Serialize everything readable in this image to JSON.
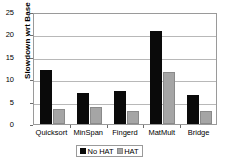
{
  "chart_data": {
    "type": "bar",
    "title": "",
    "xlabel": "",
    "ylabel": "Slowdown wrt Base",
    "categories": [
      "Quicksort",
      "MinSpan",
      "Fingerd",
      "MatMult",
      "Bridge"
    ],
    "series": [
      {
        "name": "No HAT",
        "color": "#0a0a0a",
        "values": [
          12.0,
          7.0,
          7.3,
          20.7,
          6.5
        ]
      },
      {
        "name": "HAT",
        "color": "#a5a5a5",
        "values": [
          3.4,
          3.8,
          2.8,
          11.5,
          3.0
        ]
      }
    ],
    "ylim": [
      0,
      25
    ],
    "yticks": [
      0,
      5,
      10,
      15,
      20,
      25
    ],
    "ytick_labels": [
      "0",
      "5",
      "10",
      "15",
      "20",
      "25"
    ],
    "grid": true,
    "legend_position": "bottom",
    "legend_entries": [
      "No HAT",
      "HAT"
    ]
  }
}
